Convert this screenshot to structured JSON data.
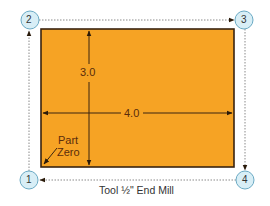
{
  "diagram": {
    "title": "Tool ½\" End Mill",
    "workpiece": {
      "color": "#f6a324",
      "border_color": "#3a2410",
      "width_label": "4.0",
      "height_label": "3.0",
      "origin_label_line1": "Part",
      "origin_label_line2": "Zero"
    },
    "points": [
      {
        "id": "1",
        "label": "1",
        "position": "bottom-left"
      },
      {
        "id": "2",
        "label": "2",
        "position": "top-left"
      },
      {
        "id": "3",
        "label": "3",
        "position": "top-right"
      },
      {
        "id": "4",
        "label": "4",
        "position": "bottom-right"
      }
    ],
    "tool_path_order": [
      "1",
      "2",
      "3",
      "4",
      "1"
    ],
    "colors": {
      "node_fill": "#d8eef6",
      "node_stroke": "#6aaac4",
      "path_line": "#888888",
      "dimension_line": "#3a2410"
    }
  }
}
